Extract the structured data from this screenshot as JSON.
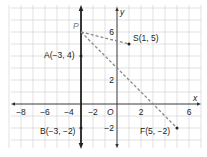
{
  "diagram": {
    "type": "coordinate-plane",
    "x_axis_label": "x",
    "y_axis_label": "y",
    "origin_label": "O",
    "x_range": [
      -9,
      7
    ],
    "y_range": [
      -3.5,
      8
    ],
    "x_ticks": [
      {
        "value": -8,
        "label": "−8"
      },
      {
        "value": -6,
        "label": "−6"
      },
      {
        "value": -4,
        "label": "−4"
      },
      {
        "value": -2,
        "label": "−2"
      },
      {
        "value": 2,
        "label": "2"
      },
      {
        "value": 6,
        "label": "6"
      }
    ],
    "y_ticks": [
      {
        "value": 6,
        "label": "6"
      },
      {
        "value": 2,
        "label": "2"
      },
      {
        "value": -2,
        "label": "−2"
      }
    ],
    "points": {
      "P": {
        "label": "P",
        "x": -3,
        "y": 5.8
      },
      "A": {
        "label": "A(−3, 4)",
        "x": -3,
        "y": 4
      },
      "B": {
        "label": "B(−3, −2)",
        "x": -3,
        "y": -2
      },
      "S": {
        "label": "S(1, 5)",
        "x": 1,
        "y": 5
      },
      "F": {
        "label": "F(5, −2)",
        "x": 5,
        "y": -2
      }
    },
    "lines": [
      {
        "name": "line-AB",
        "style": "solid-thick",
        "through": [
          "A",
          "B"
        ],
        "color": "#222222"
      },
      {
        "name": "segment-PS",
        "style": "dashed",
        "from": "P",
        "to": "S",
        "color": "#888888"
      },
      {
        "name": "segment-PF",
        "style": "dashed",
        "from": "P",
        "to": "F",
        "color": "#888888"
      }
    ],
    "colors": {
      "grid": "#cfcfcf",
      "axis": "#333333",
      "dashed": "#8a8a8a",
      "text": "#222222"
    }
  }
}
